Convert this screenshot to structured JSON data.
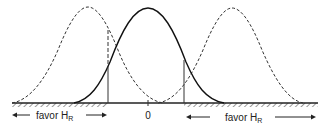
{
  "diagram": {
    "type": "hypothesis-test-regions",
    "center_label": "0",
    "left_region_label": "favor H",
    "left_region_subscript": "R",
    "right_region_label": "favor H",
    "right_region_subscript": "R",
    "curves": [
      {
        "name": "null-distribution",
        "style": "solid",
        "center": 0
      },
      {
        "name": "left-alternative-distribution",
        "style": "dashed",
        "center": "negative"
      },
      {
        "name": "right-alternative-distribution",
        "style": "dashed",
        "center": "positive"
      }
    ],
    "colors": {
      "line": "#222222",
      "hatch": "#555555",
      "background": "#ffffff"
    }
  }
}
